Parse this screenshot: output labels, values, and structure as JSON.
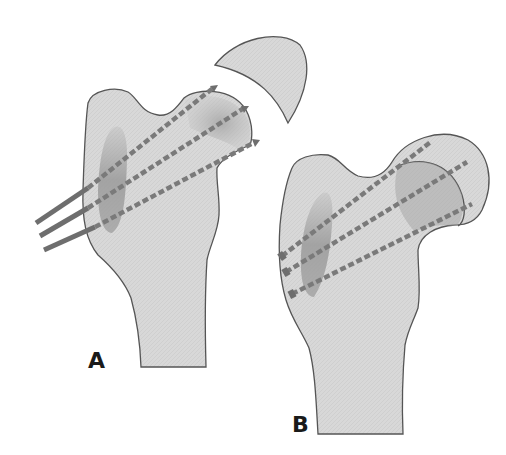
{
  "figure": {
    "panels": [
      {
        "id": "A",
        "label": "A"
      },
      {
        "id": "B",
        "label": "B"
      }
    ]
  },
  "colors": {
    "bone_fill": "#d9d9d9",
    "bone_outline": "#555555",
    "shade": "#9a9a9a",
    "pin": "#6e6e6e",
    "pin_dash": "#8a8a8a",
    "background": "#ffffff",
    "label": "#1a1a1a"
  }
}
